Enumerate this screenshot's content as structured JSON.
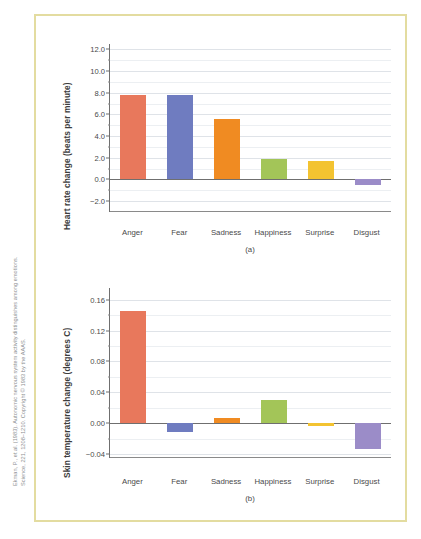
{
  "figure": {
    "border_color": "#e3dca0",
    "citation_line1": "Ekman, P., et al. (1983). Autonomic nervous system activity distinguishes among emotions.",
    "citation_line2": "Science, 221, 1208–1210. Copyright © 1983 by the AAAS."
  },
  "palette": {
    "anger": "#e8785c",
    "fear": "#6f7cc0",
    "sadness": "#f08b22",
    "happiness": "#a3c558",
    "surprise": "#f3c331",
    "disgust": "#9b8cc8"
  },
  "chart_data": [
    {
      "type": "bar",
      "panel": "(a)",
      "title": "",
      "xlabel": "",
      "ylabel": "Heart rate change (beats per minute)",
      "categories": [
        "Anger",
        "Fear",
        "Sadness",
        "Happiness",
        "Surprise",
        "Disgust"
      ],
      "values": [
        7.8,
        7.8,
        5.6,
        1.9,
        1.7,
        -0.5
      ],
      "colors": [
        "#e8785c",
        "#6f7cc0",
        "#f08b22",
        "#a3c558",
        "#f3c331",
        "#9b8cc8"
      ],
      "ylim": [
        -3.0,
        12.5
      ],
      "yticks": [
        "12.0",
        "10.0",
        "8.0",
        "6.0",
        "4.0",
        "2.0",
        "0.0",
        "-2.0"
      ],
      "ytick_values": [
        12.0,
        10.0,
        8.0,
        6.0,
        4.0,
        2.0,
        0.0,
        -2.0
      ],
      "minor_tick_values": [
        11.0,
        9.0,
        7.0,
        5.0,
        3.0,
        1.0,
        -1.0
      ],
      "grid": true,
      "legend": "none"
    },
    {
      "type": "bar",
      "panel": "(b)",
      "title": "",
      "xlabel": "",
      "ylabel": "Skin temperature change (degrees C)",
      "categories": [
        "Anger",
        "Fear",
        "Sadness",
        "Happiness",
        "Surprise",
        "Disgust"
      ],
      "values": [
        0.145,
        -0.011,
        0.007,
        0.03,
        -0.004,
        -0.034
      ],
      "colors": [
        "#e8785c",
        "#6f7cc0",
        "#f08b22",
        "#a3c558",
        "#f3c331",
        "#9b8cc8"
      ],
      "ylim": [
        -0.045,
        0.175
      ],
      "yticks": [
        "0.16",
        "0.12",
        "0.08",
        "0.04",
        "0.00",
        "-0.04"
      ],
      "ytick_values": [
        0.16,
        0.12,
        0.08,
        0.04,
        0.0,
        -0.04
      ],
      "minor_tick_values": [
        0.14,
        0.1,
        0.06,
        0.02,
        -0.02
      ],
      "grid": true,
      "legend": "none"
    }
  ]
}
